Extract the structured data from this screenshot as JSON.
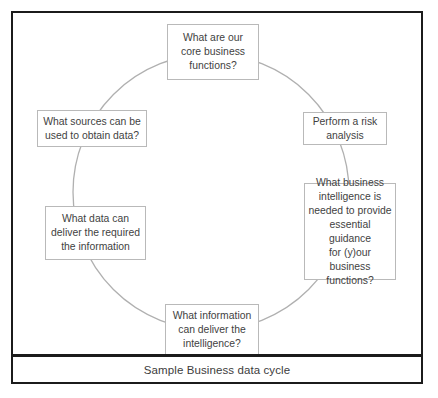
{
  "figure": {
    "caption": "Sample Business data cycle",
    "diagram_type": "cycle",
    "colors": {
      "frame_border": "#1b1b1b",
      "node_border": "#b9b9b9",
      "ring_stroke": "#b0b0b0",
      "text": "#3f3f3f",
      "background": "#ffffff"
    }
  },
  "cycle": {
    "nodes": [
      {
        "id": "core-business-functions",
        "position": "top",
        "lines": [
          "What are our",
          "core business",
          "functions?"
        ],
        "text": "What are our core business functions?"
      },
      {
        "id": "risk-analysis",
        "position": "upper-right",
        "lines": [
          "Perform a risk",
          "analysis"
        ],
        "text": "Perform a risk analysis"
      },
      {
        "id": "business-intelligence",
        "position": "lower-right",
        "lines": [
          "What business",
          "intelligence is",
          "needed to provide",
          "essential guidance",
          "for (y)our business",
          "functions?"
        ],
        "text": "What business intelligence is needed to provide essential guidance for (y)our business functions?"
      },
      {
        "id": "information-delivers-intelligence",
        "position": "bottom",
        "lines": [
          "What information",
          "can deliver the",
          "intelligence?"
        ],
        "text": "What information can deliver the intelligence?"
      },
      {
        "id": "data-delivers-information",
        "position": "lower-left",
        "lines": [
          "What data can",
          "deliver the required",
          "the information"
        ],
        "text": "What data can deliver the required the information"
      },
      {
        "id": "sources-to-obtain-data",
        "position": "upper-left",
        "lines": [
          "What sources can be",
          "used to obtain data?"
        ],
        "text": "What sources can be used to obtain data?"
      }
    ]
  }
}
